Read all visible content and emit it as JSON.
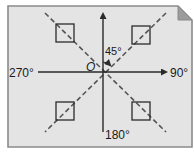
{
  "diagram": {
    "labels": {
      "top": "",
      "right": "90°",
      "bottom": "180°",
      "left": "270°",
      "origin": "O",
      "angle": "45°"
    },
    "colors": {
      "page_fill": "#e4e4e4",
      "page_border": "#8a8a8a",
      "fold_fill": "#9c9c9c",
      "line": "#2a2a2a",
      "dashed": "#555555"
    },
    "squares_count": 4
  }
}
